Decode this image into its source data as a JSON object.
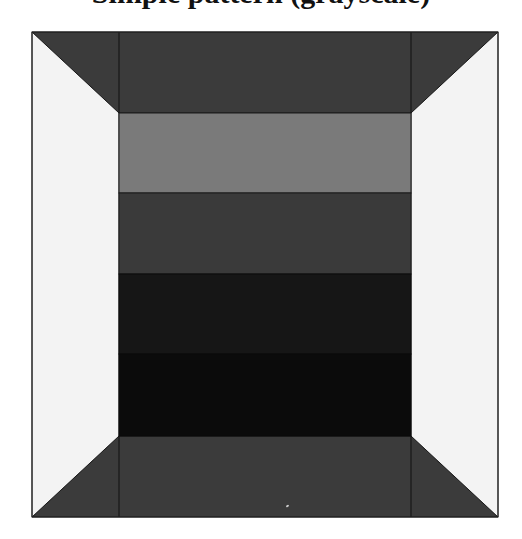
{
  "title": {
    "text": "Simple pattern (grayscale)",
    "clipped": true
  },
  "figure": {
    "outer": {
      "x": 32,
      "y": 32,
      "w": 466,
      "h": 485
    },
    "inner": {
      "x": 119,
      "y": 113,
      "w": 292,
      "h": 323
    },
    "panels": {
      "top": {
        "color": "#3b3b3b"
      },
      "bottom": {
        "color": "#3b3b3b"
      },
      "left": {
        "color": "#f3f3f3"
      },
      "right": {
        "color": "#f3f3f3"
      }
    },
    "stripes": [
      {
        "label": "stripe-1",
        "y": 113,
        "h": 80,
        "color": "#7a7a7a"
      },
      {
        "label": "stripe-2",
        "y": 193,
        "h": 81,
        "color": "#3a3a3a"
      },
      {
        "label": "stripe-3",
        "y": 274,
        "h": 80,
        "color": "#161616"
      },
      {
        "label": "stripe-4",
        "y": 354,
        "h": 82,
        "color": "#0b0b0b"
      }
    ],
    "edge_color": "#1a1a1a"
  }
}
